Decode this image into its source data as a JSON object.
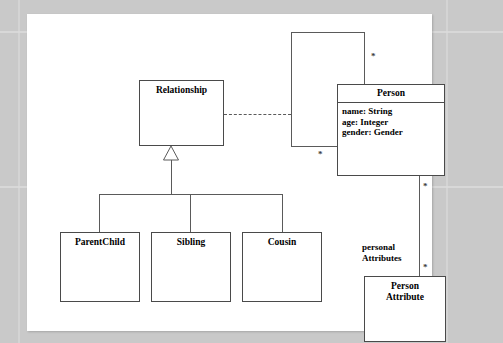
{
  "diagram": {
    "type": "uml-class-diagram",
    "background_color": "#c9c9c9",
    "page_color": "#ffffff",
    "line_color": "#5a5a5a",
    "classes": [
      {
        "id": "relationship",
        "name": "Relationship",
        "attributes": [],
        "x": 112,
        "y": 66,
        "width": 85,
        "height": 66
      },
      {
        "id": "person",
        "name": "Person",
        "attributes": [
          "name: String",
          "age: Integer",
          "gender: Gender"
        ],
        "x": 310,
        "y": 70,
        "width": 108,
        "height": 92
      },
      {
        "id": "parentchild",
        "name": "ParentChild",
        "attributes": [],
        "x": 33,
        "y": 218,
        "width": 80,
        "height": 70
      },
      {
        "id": "sibling",
        "name": "Sibling",
        "attributes": [],
        "x": 124,
        "y": 218,
        "width": 80,
        "height": 70
      },
      {
        "id": "cousin",
        "name": "Cousin",
        "attributes": [],
        "x": 215,
        "y": 218,
        "width": 80,
        "height": 70
      },
      {
        "id": "personattribute",
        "name": "Person\nAttribute",
        "attributes": [],
        "x": 337,
        "y": 262,
        "width": 82,
        "height": 66
      }
    ],
    "multiplicities": [
      {
        "id": "person-self-top",
        "label": "*"
      },
      {
        "id": "person-self-left",
        "label": "*"
      },
      {
        "id": "person-attr-upper",
        "label": "*"
      },
      {
        "id": "person-attr-lower",
        "label": "*"
      }
    ],
    "edge_labels": [
      {
        "id": "personal-attributes",
        "label": "personal\nAttributes"
      }
    ],
    "relations": [
      {
        "id": "generalization",
        "kind": "generalization",
        "from": "relationship",
        "to": [
          "parentchild",
          "sibling",
          "cousin"
        ]
      },
      {
        "id": "association-dashed",
        "kind": "dependency",
        "from": "relationship",
        "to": "person"
      },
      {
        "id": "person-self-assoc",
        "kind": "association",
        "from": "person",
        "to": "person"
      },
      {
        "id": "person-personattribute",
        "kind": "association",
        "from": "person",
        "to": "personattribute"
      }
    ]
  }
}
